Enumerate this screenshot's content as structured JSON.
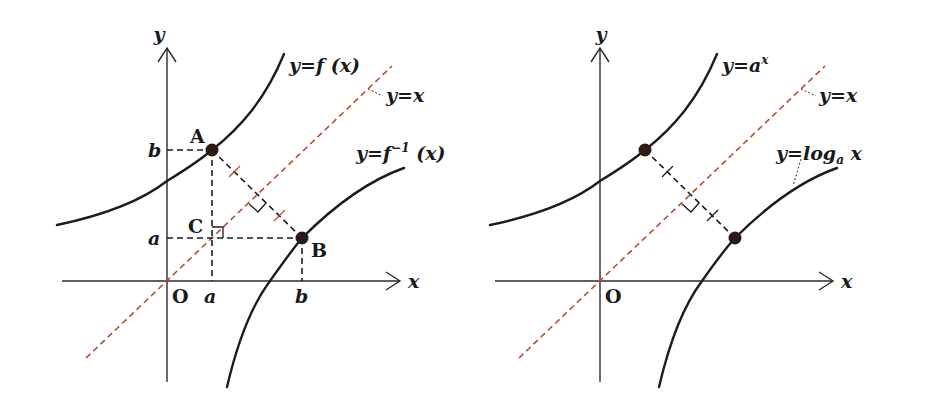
{
  "colors": {
    "curve": "#1c1c1c",
    "identity_line": "#b5502f",
    "point": "#2b1a16"
  },
  "panels": [
    {
      "id": "left",
      "axis_labels": {
        "x": "x",
        "y": "y",
        "origin": "O"
      },
      "curves": [
        {
          "name": "f",
          "label": "y=f (x)"
        },
        {
          "name": "f_inverse",
          "label_main": "y=f",
          "label_sup": "−1",
          "label_tail": " (x)"
        },
        {
          "name": "identity",
          "label": "y=x"
        }
      ],
      "points": [
        {
          "name": "A",
          "label": "A",
          "coords": [
            "a",
            "b"
          ]
        },
        {
          "name": "B",
          "label": "B",
          "coords": [
            "b",
            "a"
          ]
        },
        {
          "name": "C",
          "label": "C",
          "coords": [
            "a",
            "a"
          ]
        }
      ],
      "tick_labels": {
        "x_a": "a",
        "x_b": "b",
        "y_a": "a",
        "y_b": "b"
      }
    },
    {
      "id": "right",
      "axis_labels": {
        "x": "x",
        "y": "y",
        "origin": "O"
      },
      "curves": [
        {
          "name": "exponential",
          "label_main": "y=a",
          "label_sup": "x"
        },
        {
          "name": "logarithm",
          "label_main": "y=log",
          "label_sub": "a",
          "label_tail": " x"
        },
        {
          "name": "identity",
          "label": "y=x"
        }
      ]
    }
  ]
}
